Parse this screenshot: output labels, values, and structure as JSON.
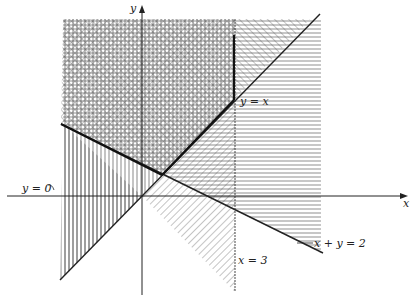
{
  "diagram": {
    "type": "linear-inequality-regions",
    "axes": {
      "x_label": "x",
      "y_label": "y"
    },
    "lines": [
      {
        "id": "y_eq_0",
        "label": "y = 0",
        "kind": "x-axis"
      },
      {
        "id": "y_eq_x",
        "label": "y = x",
        "kind": "diagonal"
      },
      {
        "id": "x_eq_3",
        "label": "x = 3",
        "kind": "vertical"
      },
      {
        "id": "x_plus_y_eq_2",
        "label": "x + y = 2",
        "kind": "diagonal"
      }
    ],
    "labels": {
      "y_axis": "y",
      "x_axis": "x",
      "y0": "y = 0",
      "yx": "y = x",
      "x3": "x = 3",
      "xy2": "x + y = 2"
    },
    "colors": {
      "ink": "#222222",
      "hatch": "#555555",
      "background": "#ffffff"
    },
    "hatching": {
      "vertical": "region x ≤ 3 (left of x = 3), above x-axis clipped",
      "horizontal": "region y ≥ 0 / right side horizontal lines",
      "diagonal_down": "region x + y ≥ 2 side",
      "diagonal_up": "region y ≥ x side"
    }
  }
}
